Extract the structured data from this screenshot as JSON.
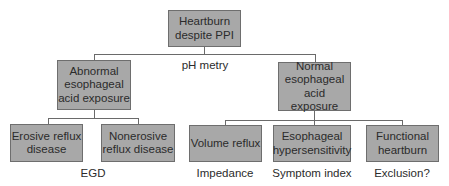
{
  "diagram": {
    "root": {
      "label": "Heartburn\ndespite PPI"
    },
    "root_test": "pH metry",
    "branches": [
      {
        "label": "Abnormal\nesophageal\nacid exposure",
        "children": [
          {
            "label": "Erosive reflux\ndisease"
          },
          {
            "label": "Nonerosive\nreflux disease"
          }
        ],
        "test": "EGD"
      },
      {
        "label": "Normal\nesophageal\nacid exposure",
        "children": [
          {
            "label": "Volume reflux",
            "test": "Impedance"
          },
          {
            "label": "Esophageal\nhypersensitivity",
            "test": "Symptom index"
          },
          {
            "label": "Functional\nheartburn",
            "test": "Exclusion?"
          }
        ]
      }
    ]
  },
  "colors": {
    "box_fill": "#a8a8a8",
    "box_border": "#6e6e6e",
    "line": "#6a6a6a",
    "text": "#2b2b2b"
  }
}
